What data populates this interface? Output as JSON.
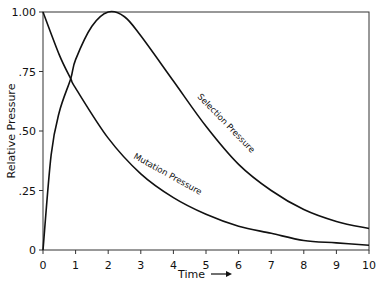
{
  "chart_data": {
    "type": "line",
    "title": "",
    "xlabel": "Time",
    "ylabel": "Relative Pressure",
    "xlim": [
      0,
      10
    ],
    "ylim": [
      0,
      1.0
    ],
    "x_ticks": [
      "0",
      "1",
      "2",
      "3",
      "4",
      "5",
      "6",
      "7",
      "8",
      "9",
      "10"
    ],
    "y_ticks": [
      "0",
      ".25",
      ".50",
      ".75",
      "1.00"
    ],
    "series": [
      {
        "name": "Selection Pressure",
        "x": [
          0,
          0.25,
          0.5,
          0.85,
          1,
          1.5,
          2,
          2.5,
          3,
          4,
          5,
          6,
          7,
          8,
          9,
          10
        ],
        "values": [
          0.0,
          0.4,
          0.58,
          0.72,
          0.8,
          0.94,
          1.0,
          0.98,
          0.9,
          0.71,
          0.52,
          0.36,
          0.25,
          0.17,
          0.12,
          0.09
        ]
      },
      {
        "name": "Mutation Pressure",
        "x": [
          0,
          0.5,
          0.85,
          1,
          2,
          3,
          4,
          5,
          6,
          7,
          8,
          9,
          10
        ],
        "values": [
          1.0,
          0.82,
          0.72,
          0.68,
          0.47,
          0.32,
          0.22,
          0.15,
          0.1,
          0.07,
          0.04,
          0.03,
          0.02
        ]
      }
    ],
    "annotations": [
      "Selection Pressure",
      "Mutation Pressure"
    ],
    "grid": false
  }
}
